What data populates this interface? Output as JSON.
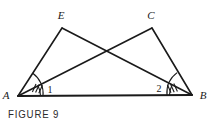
{
  "figure": {
    "caption": "FIGURE 9",
    "background_color": "#ffffff",
    "stroke_color": "#1a1a1a",
    "label_color": "#1a1a1a"
  },
  "vertices": {
    "A": {
      "label": "A",
      "x": 18,
      "y": 96
    },
    "B": {
      "label": "B",
      "x": 192,
      "y": 95
    },
    "E": {
      "label": "E",
      "x": 62,
      "y": 28
    },
    "C": {
      "label": "C",
      "x": 152,
      "y": 28
    }
  },
  "angle_labels": {
    "one": "1",
    "two": "2"
  },
  "segments": [
    {
      "name": "AB",
      "from": "A",
      "to": "B"
    },
    {
      "name": "AE",
      "from": "A",
      "to": "E"
    },
    {
      "name": "EB",
      "from": "E",
      "to": "B"
    },
    {
      "name": "AC",
      "from": "A",
      "to": "C"
    },
    {
      "name": "CB",
      "from": "C",
      "to": "B"
    }
  ],
  "angle_marks": {
    "at_A": {
      "arcs": 2,
      "ticks": 3,
      "description": "double arc with three tick marks"
    },
    "at_B": {
      "arcs": 2,
      "ticks": 3,
      "description": "double arc with three tick marks"
    }
  }
}
